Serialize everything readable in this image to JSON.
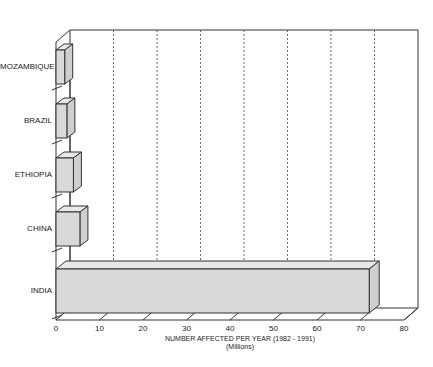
{
  "chart_data": {
    "type": "bar",
    "orientation": "horizontal",
    "style": "3d",
    "title": "",
    "categories": [
      "MOZAMBIQUE",
      "BRAZIL",
      "ETHIOPIA",
      "CHINA",
      "INDIA"
    ],
    "values": [
      2,
      2.5,
      4,
      5.5,
      72
    ],
    "xlabel": "NUMBER AFFECTED PER YEAR (1982 - 1991)",
    "xlabel_sub": "(Millions)",
    "ylabel": "",
    "xlim": [
      0,
      80
    ],
    "xticks": [
      "0",
      "10",
      "20",
      "30",
      "40",
      "50",
      "60",
      "70",
      "80"
    ],
    "grid": "vertical dashed",
    "legend": "none",
    "bar_color": "#d9d9d9"
  }
}
